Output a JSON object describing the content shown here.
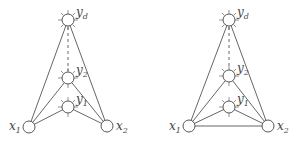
{
  "diagrams": [
    {
      "id": "left",
      "nodes": {
        "yd": {
          "label": "y",
          "sub": "d",
          "x": 68,
          "y": 20
        },
        "y2": {
          "label": "y",
          "sub": "2",
          "x": 68,
          "y": 78
        },
        "y1": {
          "label": "y",
          "sub": "1",
          "x": 68,
          "y": 107
        },
        "x1": {
          "label": "x",
          "sub": "1",
          "x": 29,
          "y": 127
        },
        "x2": {
          "label": "x",
          "sub": "2",
          "x": 107,
          "y": 126
        }
      },
      "edges": [
        "x1-yd",
        "x2-yd",
        "x1-y2",
        "x2-y2",
        "x1-y1",
        "x2-y1"
      ],
      "dashed": [
        "yd-y2"
      ],
      "x1_x2_edge": false
    },
    {
      "id": "right",
      "nodes": {
        "yd": {
          "label": "y",
          "sub": "d",
          "x": 229,
          "y": 20
        },
        "y2": {
          "label": "y",
          "sub": "2",
          "x": 229,
          "y": 76
        },
        "y1": {
          "label": "y",
          "sub": "1",
          "x": 229,
          "y": 107
        },
        "x1": {
          "label": "x",
          "sub": "1",
          "x": 189,
          "y": 126
        },
        "x2": {
          "label": "x",
          "sub": "2",
          "x": 268,
          "y": 126
        }
      },
      "edges": [
        "x1-yd",
        "x2-yd",
        "x1-y2",
        "x2-y2",
        "x1-y1",
        "x2-y1",
        "x1-x2"
      ],
      "dashed": [
        "yd-y2"
      ],
      "x1_x2_edge": true
    }
  ],
  "labels": {
    "left": {
      "yd": "y",
      "yd_sub": "d",
      "y2": "y",
      "y2_sub": "2",
      "y1": "y",
      "y1_sub": "1",
      "x1": "x",
      "x1_sub": "1",
      "x2": "x",
      "x2_sub": "2"
    },
    "right": {
      "yd": "y",
      "yd_sub": "d",
      "y2": "y",
      "y2_sub": "2",
      "y1": "y",
      "y1_sub": "1",
      "x1": "x",
      "x1_sub": "1",
      "x2": "x",
      "x2_sub": "2"
    }
  }
}
